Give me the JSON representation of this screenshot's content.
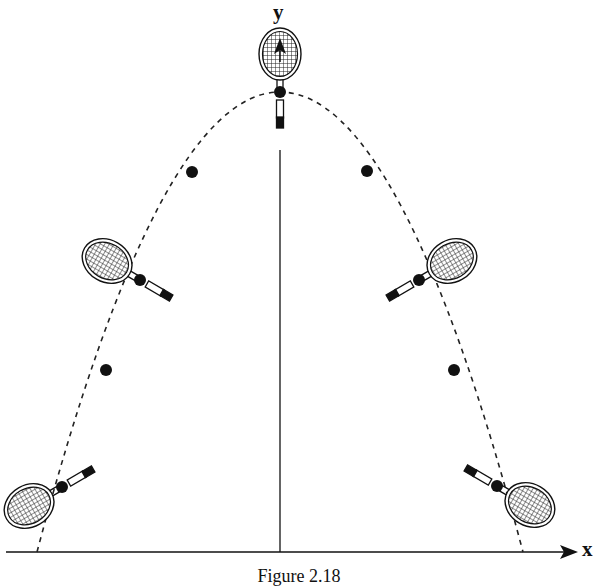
{
  "figure": {
    "caption": "Figure 2.18",
    "axes": {
      "x_label": "x",
      "y_label": "y",
      "origin": [
        280,
        552
      ],
      "x_axis": {
        "from": 6,
        "to": 578,
        "y": 552
      },
      "y_axis": {
        "from": 552,
        "to": 155,
        "x": 280
      }
    },
    "trajectory": {
      "shape": "parabola",
      "style": "dashed",
      "apex": [
        280,
        92
      ],
      "roots": [
        37,
        523
      ],
      "base_y": 552
    },
    "center_of_mass_points": [
      {
        "x": 62,
        "y": 487
      },
      {
        "x": 106,
        "y": 370
      },
      {
        "x": 140,
        "y": 280
      },
      {
        "x": 192,
        "y": 172
      },
      {
        "x": 280,
        "y": 92
      },
      {
        "x": 367,
        "y": 171
      },
      {
        "x": 419,
        "y": 280
      },
      {
        "x": 454,
        "y": 370
      },
      {
        "x": 497,
        "y": 486
      }
    ],
    "rackets": [
      {
        "name": "racket-left-low",
        "cx": 62,
        "cy": 487,
        "angle": 60
      },
      {
        "name": "racket-left-mid",
        "cx": 140,
        "cy": 280,
        "angle": 120
      },
      {
        "name": "racket-top",
        "cx": 280,
        "cy": 92,
        "angle": 180
      },
      {
        "name": "racket-right-mid",
        "cx": 419,
        "cy": 280,
        "angle": 240
      },
      {
        "name": "racket-right-low",
        "cx": 497,
        "cy": 486,
        "angle": 300
      }
    ],
    "colors": {
      "ink": "#111111",
      "background": "#ffffff"
    }
  }
}
